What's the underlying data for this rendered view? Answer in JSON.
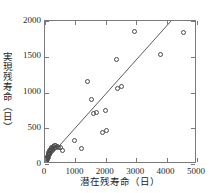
{
  "chart_data": {
    "type": "scatter",
    "title": "",
    "xlabel": "潜在残寿命（日）",
    "ylabel": "実現残寿命（日）",
    "xlim": [
      0,
      5000
    ],
    "ylim": [
      0,
      2000
    ],
    "xticks": [
      0,
      1000,
      2000,
      3000,
      4000,
      5000
    ],
    "xtick_labels": [
      "0",
      "1000",
      "2000",
      "3000",
      "4000",
      "5000"
    ],
    "yticks": [
      0,
      500,
      1000,
      1500,
      2000
    ],
    "ytick_labels": [
      "0",
      "500",
      "1000",
      "1500",
      "2000"
    ],
    "grid": false,
    "legend": null,
    "marker_style": "open-circle",
    "marker_color": "#4a4a4a",
    "line_color": "#4a4a4a",
    "frame_color": "#7a7a7a",
    "background": "#ffffff",
    "points": [
      {
        "x": 30,
        "y": 40
      },
      {
        "x": 45,
        "y": 55
      },
      {
        "x": 55,
        "y": 70
      },
      {
        "x": 60,
        "y": 45
      },
      {
        "x": 70,
        "y": 90
      },
      {
        "x": 75,
        "y": 60
      },
      {
        "x": 85,
        "y": 110
      },
      {
        "x": 90,
        "y": 75
      },
      {
        "x": 100,
        "y": 130
      },
      {
        "x": 105,
        "y": 95
      },
      {
        "x": 115,
        "y": 150
      },
      {
        "x": 120,
        "y": 115
      },
      {
        "x": 130,
        "y": 165
      },
      {
        "x": 140,
        "y": 135
      },
      {
        "x": 150,
        "y": 185
      },
      {
        "x": 160,
        "y": 150
      },
      {
        "x": 170,
        "y": 200
      },
      {
        "x": 185,
        "y": 170
      },
      {
        "x": 200,
        "y": 215
      },
      {
        "x": 215,
        "y": 190
      },
      {
        "x": 230,
        "y": 230
      },
      {
        "x": 250,
        "y": 205
      },
      {
        "x": 265,
        "y": 245
      },
      {
        "x": 285,
        "y": 220
      },
      {
        "x": 300,
        "y": 255
      },
      {
        "x": 330,
        "y": 235
      },
      {
        "x": 360,
        "y": 265
      },
      {
        "x": 400,
        "y": 250
      },
      {
        "x": 450,
        "y": 230
      },
      {
        "x": 520,
        "y": 225
      },
      {
        "x": 560,
        "y": 195
      },
      {
        "x": 980,
        "y": 325
      },
      {
        "x": 1190,
        "y": 215
      },
      {
        "x": 1390,
        "y": 1160
      },
      {
        "x": 1520,
        "y": 905
      },
      {
        "x": 1600,
        "y": 705
      },
      {
        "x": 1700,
        "y": 725
      },
      {
        "x": 1880,
        "y": 445
      },
      {
        "x": 1980,
        "y": 755
      },
      {
        "x": 2020,
        "y": 470
      },
      {
        "x": 2350,
        "y": 1460
      },
      {
        "x": 2390,
        "y": 1055
      },
      {
        "x": 2510,
        "y": 1085
      },
      {
        "x": 2960,
        "y": 1855
      },
      {
        "x": 3790,
        "y": 1530
      },
      {
        "x": 4540,
        "y": 1840
      }
    ],
    "fit_line": {
      "x_start": 120,
      "y_start": 60,
      "x_end": 4200,
      "y_end": 2000,
      "slope": 0.4755,
      "intercept": 2.9
    }
  }
}
